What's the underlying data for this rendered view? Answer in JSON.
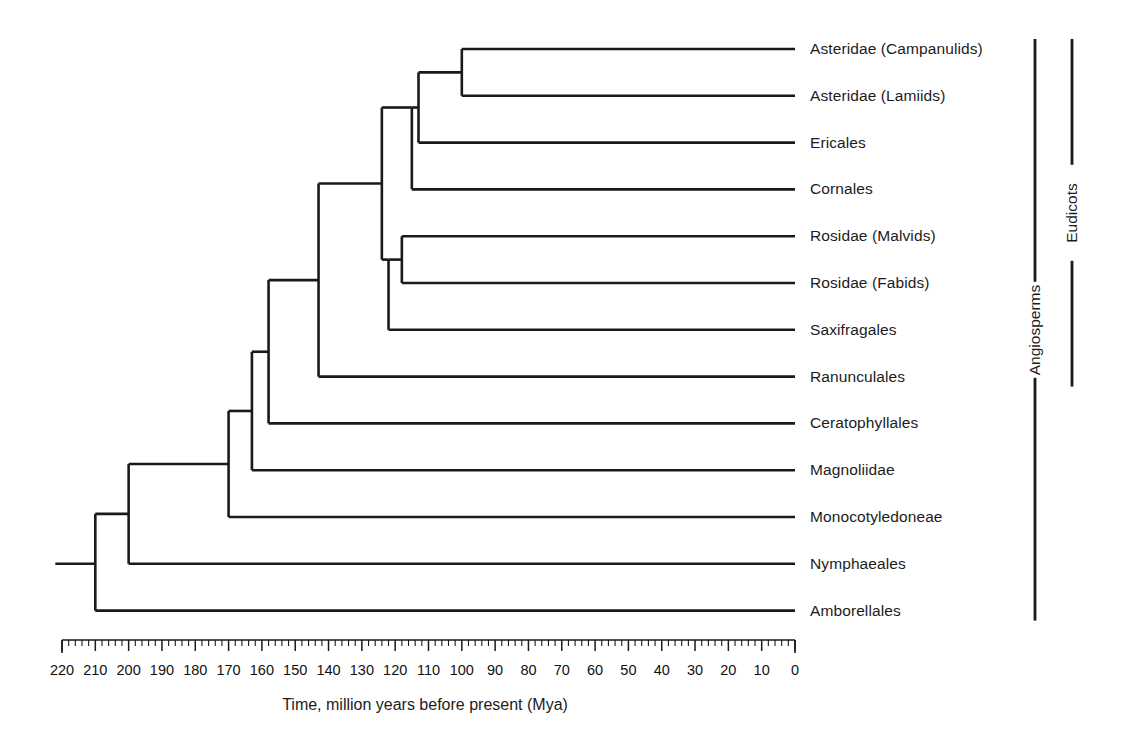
{
  "figure": {
    "kind": "phylogenetic-tree-cladogram",
    "background_color": "#ffffff",
    "line_color": "#1a1a1a"
  },
  "axis": {
    "title": "Time, million years before present (Mya)",
    "unit": "Mya",
    "direction": "reversed",
    "domain_start": 220,
    "domain_end": 0,
    "major_tick_step": 10,
    "minor_tick_step": 2,
    "tick_labels": [
      "220",
      "210",
      "200",
      "190",
      "180",
      "170",
      "160",
      "150",
      "140",
      "130",
      "120",
      "110",
      "100",
      "90",
      "80",
      "70",
      "60",
      "50",
      "40",
      "30",
      "20",
      "10",
      "0"
    ],
    "pixel_left": 62,
    "pixel_right": 795
  },
  "tips": [
    {
      "id": "asteridae-campanulids",
      "label": "Asteridae (Campanulids)",
      "row": 0,
      "branch_start_mya": 100
    },
    {
      "id": "asteridae-lamiids",
      "label": "Asteridae (Lamiids)",
      "row": 1,
      "branch_start_mya": 100
    },
    {
      "id": "ericales",
      "label": "Ericales",
      "row": 2,
      "branch_start_mya": 113
    },
    {
      "id": "cornales",
      "label": "Cornales",
      "row": 3,
      "branch_start_mya": 115
    },
    {
      "id": "rosidae-malvids",
      "label": "Rosidae (Malvids)",
      "row": 4,
      "branch_start_mya": 118
    },
    {
      "id": "rosidae-fabids",
      "label": "Rosidae (Fabids)",
      "row": 5,
      "branch_start_mya": 118
    },
    {
      "id": "saxifragales",
      "label": "Saxifragales",
      "row": 6,
      "branch_start_mya": 122
    },
    {
      "id": "ranunculales",
      "label": "Ranunculales",
      "row": 7,
      "branch_start_mya": 143
    },
    {
      "id": "ceratophyllales",
      "label": "Ceratophyllales",
      "row": 8,
      "branch_start_mya": 158
    },
    {
      "id": "magnoliidae",
      "label": "Magnoliidae",
      "row": 9,
      "branch_start_mya": 163
    },
    {
      "id": "monocotyledoneae",
      "label": "Monocotyledoneae",
      "row": 10,
      "branch_start_mya": 170
    },
    {
      "id": "nymphaeales",
      "label": "Nymphaeales",
      "row": 11,
      "branch_start_mya": 200
    },
    {
      "id": "amborellales",
      "label": "Amborellales",
      "row": 12,
      "branch_start_mya": 210
    }
  ],
  "nodes": [
    {
      "id": "node-asteridae",
      "age_mya": 100,
      "top_row": 0,
      "bottom_row": 1
    },
    {
      "id": "node-asterids-core",
      "age_mya": 113,
      "top_row": 0.5,
      "bottom_row": 2
    },
    {
      "id": "node-asterids-cornales",
      "age_mya": 115,
      "top_row": 1.25,
      "bottom_row": 3
    },
    {
      "id": "node-rosidae",
      "age_mya": 118,
      "top_row": 4,
      "bottom_row": 5
    },
    {
      "id": "node-superrosids",
      "age_mya": 122,
      "top_row": 4.5,
      "bottom_row": 6
    },
    {
      "id": "node-pentapetalae",
      "age_mya": 124,
      "top_row": 2.1,
      "bottom_row": 5.1
    },
    {
      "id": "node-eudicots",
      "age_mya": 143,
      "top_row": 3.6,
      "bottom_row": 7
    },
    {
      "id": "node-mesangiosperms",
      "age_mya": 158,
      "top_row": 5.3,
      "bottom_row": 8
    },
    {
      "id": "node-magnoliids",
      "age_mya": 163,
      "top_row": 6.65,
      "bottom_row": 9
    },
    {
      "id": "node-monocots",
      "age_mya": 170,
      "top_row": 7.8,
      "bottom_row": 10
    },
    {
      "id": "node-nymphaeales",
      "age_mya": 200,
      "top_row": 8.9,
      "bottom_row": 11
    },
    {
      "id": "node-root",
      "age_mya": 210,
      "top_row": 10.0,
      "bottom_row": 12
    }
  ],
  "root_stem": {
    "from_mya": 222,
    "to_mya": 210,
    "row": 11.0
  },
  "clade_brackets": [
    {
      "id": "bracket-eudicots",
      "label": "Eudicots",
      "from_row": 0,
      "to_row": 7,
      "x": 1072
    },
    {
      "id": "bracket-angiosperms",
      "label": "Angiosperms",
      "from_row": 0,
      "to_row": 12,
      "x": 1035
    }
  ],
  "chart_data": {
    "type": "tree",
    "title": "",
    "xlabel": "Time, million years before present (Mya)",
    "xlim": [
      220,
      0
    ],
    "grid": false,
    "leaf_divergence_ages_mya": {
      "Asteridae (Campanulids)": 100,
      "Asteridae (Lamiids)": 100,
      "Ericales": 113,
      "Cornales": 115,
      "Rosidae (Malvids)": 118,
      "Rosidae (Fabids)": 118,
      "Saxifragales": 122,
      "Ranunculales": 143,
      "Ceratophyllales": 158,
      "Magnoliidae": 163,
      "Monocotyledoneae": 170,
      "Nymphaeales": 200,
      "Amborellales": 210
    }
  }
}
